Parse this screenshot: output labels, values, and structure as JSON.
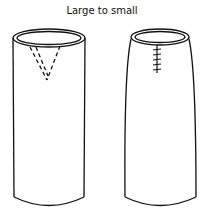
{
  "diagram": {
    "title": "Large to small",
    "figures": [
      {
        "label": "before",
        "description": "Straight cylinder with dashed V-shaped dart marked at top"
      },
      {
        "label": "after",
        "description": "Tapered cylinder with stitched seam where dart was sewn"
      }
    ],
    "colors": {
      "stroke": "#111111",
      "background": "#ffffff"
    }
  }
}
